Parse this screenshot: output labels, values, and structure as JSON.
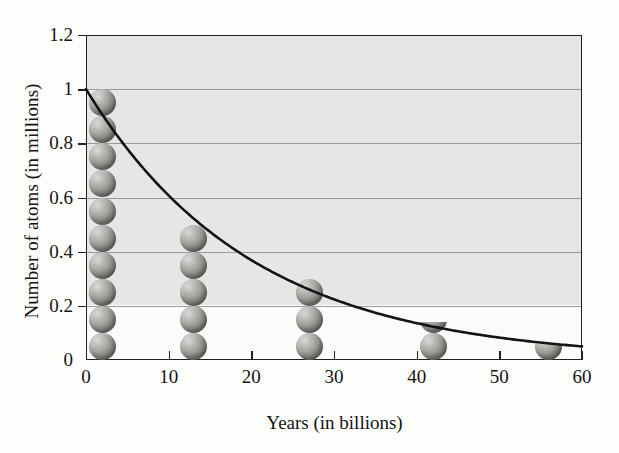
{
  "chart_data": {
    "type": "line",
    "title": "",
    "subtitle": "",
    "xlabel": "Years (in billions)",
    "ylabel": "Number of atoms (in millions)",
    "xlim": [
      0,
      60
    ],
    "ylim": [
      0,
      1.2
    ],
    "xticks": [
      0,
      10,
      20,
      30,
      40,
      50,
      60
    ],
    "xtick_labels": [
      "0",
      "10",
      "20",
      "30",
      "40",
      "50",
      "60"
    ],
    "yticks": [
      0,
      0.2,
      0.4,
      0.6,
      0.8,
      1,
      1.2
    ],
    "ytick_labels": [
      "0",
      "0.2",
      "0.4",
      "0.6",
      "0.8",
      "1",
      "1.2"
    ],
    "grid": "horizontal",
    "gridlines_y": [
      0.2,
      0.4,
      0.6,
      0.8,
      1
    ],
    "legend": null,
    "series": [
      {
        "name": "Exponential decay curve",
        "type": "line",
        "color": "#141414",
        "half_life": 13.9,
        "initial_value": 1,
        "x": [
          0,
          5,
          10,
          13.9,
          20,
          27.8,
          30,
          41.7,
          50,
          55.6,
          60
        ],
        "y": [
          1,
          0.78,
          0.61,
          0.5,
          0.37,
          0.25,
          0.223,
          0.125,
          0.084,
          0.0625,
          0.05
        ]
      },
      {
        "name": "Atom stacks",
        "type": "pictogram",
        "marker": "sphere",
        "sphere_color": "#8e8e8b",
        "points": [
          {
            "x": 2,
            "y": 1.0,
            "spheres": 10
          },
          {
            "x": 13,
            "y": 0.5,
            "spheres": 5
          },
          {
            "x": 27,
            "y": 0.3,
            "spheres": 3
          },
          {
            "x": 42,
            "y": 0.13,
            "spheres": 1.4
          },
          {
            "x": 56,
            "y": 0.06,
            "spheres": 0.6
          }
        ]
      }
    ],
    "annotations": []
  },
  "figure": {
    "background_color": "#fdfdfc",
    "plot_background_color": "#e6e6e4",
    "axis_color": "#20201f",
    "grid_color": "#9a9a98"
  },
  "axis": {
    "y_title": "Number of atoms (in millions)",
    "x_title": "Years (in billions)",
    "y_tick_0": "0",
    "y_tick_1": "0.2",
    "y_tick_2": "0.4",
    "y_tick_3": "0.6",
    "y_tick_4": "0.8",
    "y_tick_5": "1",
    "y_tick_6": "1.2",
    "x_tick_0": "0",
    "x_tick_1": "10",
    "x_tick_2": "20",
    "x_tick_3": "30",
    "x_tick_4": "40",
    "x_tick_5": "50",
    "x_tick_6": "60"
  }
}
